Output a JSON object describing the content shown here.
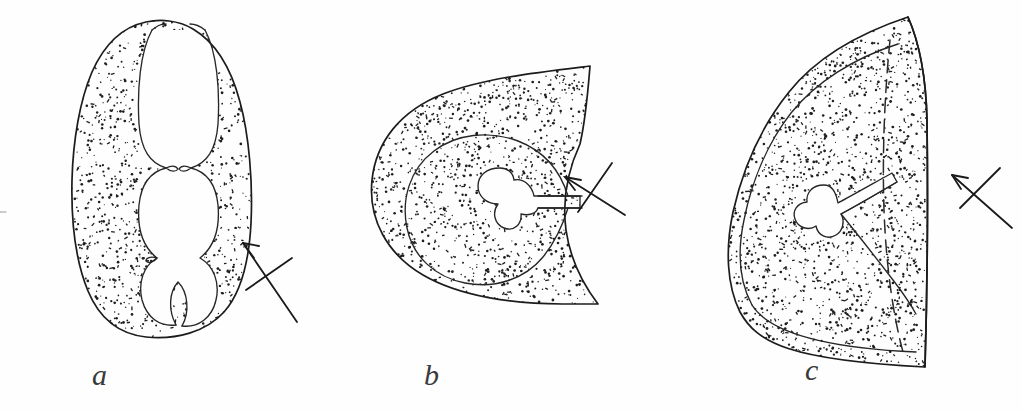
{
  "figure": {
    "kind": "scientific-line-drawing",
    "background_color": "#fefefe",
    "ink_color": "#1c1c1c",
    "width": 1022,
    "height": 411,
    "panels": [
      {
        "id": "a",
        "label": "a",
        "label_x": 92,
        "label_y": 385,
        "outline_description": "tall rounded oval with deep median cleft at top and four-lobed internal cavity",
        "has_stipple": true,
        "has_inner_contour": false,
        "has_dashed_line": false,
        "lumen_shape": "four-lobed cavity",
        "arrow": {
          "name": "pointer-arrow-a",
          "tail_x": 297,
          "tail_y": 322,
          "tip_x": 243,
          "tip_y": 243,
          "cross_x1": 246,
          "cross_y1": 290,
          "cross_x2": 292,
          "cross_y2": 258,
          "direction": "up-left"
        }
      },
      {
        "id": "b",
        "label": "b",
        "label_x": 424,
        "label_y": 385,
        "outline_description": "teardrop outline with concave notched right margin and a pointed upper and lower spur",
        "has_stipple": true,
        "has_inner_contour": true,
        "has_dashed_line": false,
        "lumen_shape": "keyhole cruciform lumen with narrow slit opening to the right margin",
        "arrow": {
          "name": "pointer-arrow-b",
          "tail_x": 625,
          "tail_y": 215,
          "tip_x": 565,
          "tip_y": 177,
          "cross_x1": 578,
          "cross_y1": 212,
          "cross_x2": 612,
          "cross_y2": 163,
          "direction": "up-left"
        }
      },
      {
        "id": "c",
        "label": "c",
        "label_x": 805,
        "label_y": 380,
        "outline_description": "broad crescent / half-lens outline with straight right margin, inner contour band and dashed internal curve",
        "has_stipple": true,
        "has_inner_contour": true,
        "has_dashed_line": true,
        "lumen_shape": "small clover-shaped lumen with tapering slit running up-right",
        "arrow": {
          "name": "pointer-arrow-c",
          "tail_x": 1012,
          "tail_y": 228,
          "tip_x": 952,
          "tip_y": 175,
          "cross_x1": 960,
          "cross_y1": 208,
          "cross_x2": 1000,
          "cross_y2": 168,
          "direction": "up-left"
        }
      }
    ]
  }
}
